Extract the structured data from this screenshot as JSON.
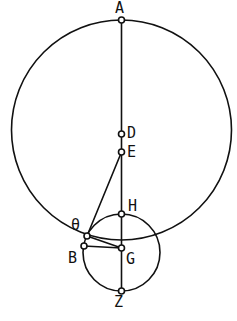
{
  "figure": {
    "canvas": {
      "width": 237,
      "height": 321,
      "background": "#ffffff"
    },
    "stroke_color": "#111111",
    "marker_fill": "#ffffff",
    "circles": [
      {
        "name": "large-circle",
        "cx": 121.5,
        "cy": 130.0,
        "r": 110.0,
        "stroke_width": 1.6
      },
      {
        "name": "small-circle",
        "cx": 121.5,
        "cy": 252.5,
        "r": 38.5,
        "stroke_width": 1.6
      }
    ],
    "points": [
      {
        "id": "A",
        "label": "A",
        "x": 121.5,
        "y": 20.0,
        "label_x": 115,
        "label_y": 1
      },
      {
        "id": "D",
        "label": "D",
        "x": 121.5,
        "y": 134.0,
        "label_x": 127,
        "label_y": 126
      },
      {
        "id": "E",
        "label": "E",
        "x": 121.5,
        "y": 152.0,
        "label_x": 127,
        "label_y": 145
      },
      {
        "id": "H",
        "label": "H",
        "x": 121.5,
        "y": 214.0,
        "label_x": 128,
        "label_y": 199
      },
      {
        "id": "TH",
        "label": "θ",
        "x": 87.0,
        "y": 236.0,
        "label_x": 71,
        "label_y": 218
      },
      {
        "id": "B",
        "label": "B",
        "x": 84.0,
        "y": 246.0,
        "label_x": 68,
        "label_y": 251
      },
      {
        "id": "G",
        "label": "G",
        "x": 121.5,
        "y": 248.0,
        "label_x": 126,
        "label_y": 252
      },
      {
        "id": "Z",
        "label": "Z",
        "x": 121.5,
        "y": 291.0,
        "label_x": 114,
        "label_y": 295
      }
    ],
    "segments": [
      {
        "name": "segment-A-Z",
        "from": "A",
        "to": "Z",
        "x1": 121.5,
        "y1": 20.0,
        "x2": 121.5,
        "y2": 291.0
      },
      {
        "name": "segment-E-theta",
        "from": "E",
        "to": "TH",
        "x1": 121.5,
        "y1": 152.0,
        "x2": 87.0,
        "y2": 236.0
      },
      {
        "name": "segment-theta-G",
        "from": "TH",
        "to": "G",
        "x1": 87.0,
        "y1": 236.0,
        "x2": 121.5,
        "y2": 248.0
      },
      {
        "name": "segment-B-G",
        "from": "B",
        "to": "G",
        "x1": 84.0,
        "y1": 246.0,
        "x2": 121.5,
        "y2": 248.0
      }
    ],
    "marker_radius": 3.0
  }
}
